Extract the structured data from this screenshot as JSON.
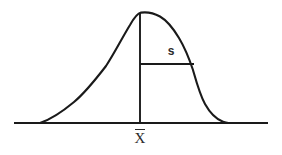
{
  "figure": {
    "background_color": "#ffffff",
    "line_color": "#1a1a1a",
    "text_color": "#2b2b2b",
    "labels": {
      "standard_deviation": "s",
      "mean": "X",
      "mean_full": "X̄"
    }
  },
  "chart_data": {
    "type": "line",
    "title": "",
    "subtitle": "",
    "xlabel": "",
    "ylabel": "",
    "grid": false,
    "legend": "none",
    "axis": {
      "baseline_drawn": true,
      "x_axis_start_px": 14,
      "x_axis_end_px": 268,
      "x_axis_y_px": 123,
      "tick_labels": [
        "X̄"
      ],
      "y_axis_drawn": false
    },
    "series": [
      {
        "name": "distribution curve",
        "description": "smooth unimodal density curve, long gradual left tail, steeper right shoulder",
        "points_px": [
          [
            40,
            123
          ],
          [
            52,
            118
          ],
          [
            64,
            110
          ],
          [
            76,
            100
          ],
          [
            88,
            89
          ],
          [
            100,
            75
          ],
          [
            112,
            58
          ],
          [
            124,
            36
          ],
          [
            132,
            21
          ],
          [
            140,
            13
          ],
          [
            150,
            12
          ],
          [
            160,
            16
          ],
          [
            170,
            24
          ],
          [
            180,
            38
          ],
          [
            188,
            54
          ],
          [
            194,
            70
          ],
          [
            200,
            88
          ],
          [
            206,
            103
          ],
          [
            213,
            113
          ],
          [
            220,
            120
          ],
          [
            228,
            123
          ]
        ]
      }
    ],
    "annotations": [
      {
        "name": "mean-line",
        "label": "X̄",
        "type": "vertical-line",
        "x_px": 140,
        "y_top_px": 13,
        "y_bottom_px": 123
      },
      {
        "name": "standard-deviation-line",
        "label": "s",
        "type": "horizontal-segment",
        "y_px": 64,
        "x_start_px": 140,
        "x_end_px": 194,
        "label_x_px": 171,
        "label_y_px": 51
      }
    ]
  }
}
